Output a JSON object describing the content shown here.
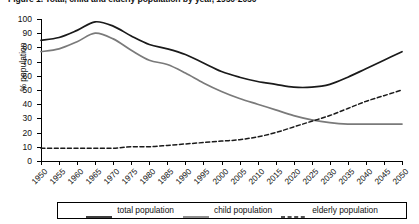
{
  "chart_data": {
    "type": "line",
    "title": "Figure 1.  Total, child and elderly population by year, 1950-2050",
    "xlabel": "",
    "ylabel": "% population",
    "xlim": [
      1950,
      2050
    ],
    "ylim": [
      0,
      100
    ],
    "ytick_step": 10,
    "grid": false,
    "legend_position": "bottom",
    "x": [
      1950,
      1955,
      1960,
      1965,
      1970,
      1975,
      1980,
      1985,
      1990,
      1995,
      2000,
      2005,
      2010,
      2015,
      2020,
      2025,
      2030,
      2035,
      2040,
      2045,
      2050
    ],
    "yticks": [
      0,
      10,
      20,
      30,
      40,
      50,
      60,
      70,
      80,
      90,
      100
    ],
    "xticklabels": [
      "1950",
      "1955",
      "1960",
      "1965",
      "1970",
      "1975",
      "1980",
      "1985",
      "1990",
      "1995",
      "2000",
      "2005",
      "2010",
      "2015",
      "2020",
      "2025",
      "2030",
      "2035",
      "2040",
      "2045",
      "2050"
    ],
    "series": [
      {
        "name": "total population",
        "style": "solid",
        "color": "#1a1a1a",
        "values": [
          85,
          87,
          92,
          98,
          95,
          88,
          82,
          79,
          75,
          69,
          63,
          59,
          56,
          54,
          52,
          52,
          54,
          59,
          65,
          71,
          77
        ]
      },
      {
        "name": "child population",
        "style": "solid",
        "color": "#7a7a7a",
        "values": [
          77,
          79,
          84,
          90,
          86,
          78,
          71,
          68,
          62,
          55,
          49,
          44,
          40,
          36,
          32,
          29,
          27,
          26,
          26,
          26,
          26
        ]
      },
      {
        "name": "elderly population",
        "style": "dashed",
        "color": "#1a1a1a",
        "values": [
          9,
          9,
          9,
          9,
          9,
          10,
          10,
          11,
          12,
          13,
          14,
          15,
          17,
          20,
          24,
          28,
          32,
          37,
          42,
          46,
          50
        ]
      }
    ]
  },
  "legend": {
    "items": [
      {
        "label": "total population"
      },
      {
        "label": "child population"
      },
      {
        "label": "elderly population"
      }
    ]
  }
}
